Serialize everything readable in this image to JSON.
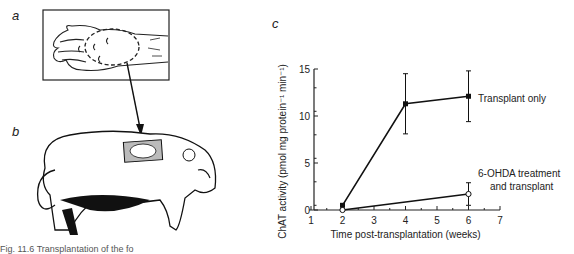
{
  "panels": {
    "a": "a",
    "b": "b",
    "c": "c"
  },
  "caption": "Fig. 11.6 Transplantation of the fo",
  "chart_data": {
    "type": "line",
    "title": "",
    "xlabel": "Time post-transplantation (weeks)",
    "ylabel": "ChAT activity (pmol mg protein⁻¹ min⁻¹)",
    "xlim": [
      1,
      7
    ],
    "ylim": [
      0,
      15
    ],
    "xticks": [
      1,
      2,
      3,
      4,
      5,
      6,
      7
    ],
    "yticks": [
      0,
      5,
      10,
      15
    ],
    "grid": false,
    "legend_position": "inline-right",
    "series": [
      {
        "name": "Transplant only",
        "marker": "filled-square",
        "x": [
          2,
          4,
          6
        ],
        "y": [
          0.5,
          11.3,
          12.1
        ],
        "error": [
          0,
          3.2,
          2.7
        ]
      },
      {
        "name": "6-OHDA treatment and transplant",
        "name_lines": [
          "6-OHDA treatment",
          "and transplant"
        ],
        "marker": "open-circle",
        "x": [
          2,
          6
        ],
        "y": [
          0,
          1.7
        ],
        "error": [
          0,
          1.2
        ]
      }
    ]
  }
}
